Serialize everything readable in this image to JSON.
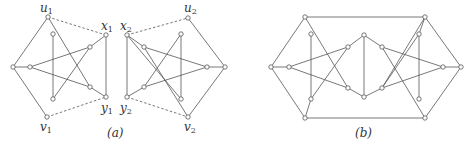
{
  "figure": {
    "panels": [
      {
        "id": "a",
        "caption": "(a)",
        "caption_pos": [
          117,
          137
        ],
        "labels": [
          {
            "base": "u",
            "sub": "1",
            "x": 40,
            "y": 12
          },
          {
            "base": "x",
            "sub": "1",
            "x": 101,
            "y": 30
          },
          {
            "base": "y",
            "sub": "1",
            "x": 101,
            "y": 112
          },
          {
            "base": "v",
            "sub": "1",
            "x": 40,
            "y": 131
          },
          {
            "base": "x",
            "sub": "2",
            "x": 120,
            "y": 30
          },
          {
            "base": "u",
            "sub": "2",
            "x": 184,
            "y": 12
          },
          {
            "base": "y",
            "sub": "2",
            "x": 120,
            "y": 112
          },
          {
            "base": "v",
            "sub": "2",
            "x": 184,
            "y": 131
          }
        ],
        "nodes": [
          [
            48,
            17
          ],
          [
            53,
            34
          ],
          [
            13,
            67
          ],
          [
            30,
            67
          ],
          [
            53,
            99
          ],
          [
            47,
            117
          ],
          [
            90,
            47
          ],
          [
            90,
            87
          ],
          [
            106,
            35
          ],
          [
            106,
            97
          ],
          [
            127,
            35
          ],
          [
            144,
            47
          ],
          [
            188,
            18
          ],
          [
            181,
            34
          ],
          [
            225,
            67
          ],
          [
            207,
            67
          ],
          [
            144,
            87
          ],
          [
            127,
            97
          ],
          [
            181,
            99
          ],
          [
            188,
            117
          ]
        ],
        "edges": [
          [
            [
              48,
              17
            ],
            [
              13,
              67
            ]
          ],
          [
            [
              13,
              67
            ],
            [
              47,
              117
            ]
          ],
          [
            [
              13,
              67
            ],
            [
              30,
              67
            ]
          ],
          [
            [
              48,
              17
            ],
            [
              90,
              87
            ]
          ],
          [
            [
              53,
              34
            ],
            [
              53,
              99
            ]
          ],
          [
            [
              30,
              67
            ],
            [
              90,
              47
            ]
          ],
          [
            [
              30,
              67
            ],
            [
              90,
              87
            ]
          ],
          [
            [
              53,
              99
            ],
            [
              90,
              47
            ]
          ],
          [
            [
              90,
              47
            ],
            [
              106,
              35
            ]
          ],
          [
            [
              90,
              87
            ],
            [
              106,
              97
            ]
          ],
          [
            [
              106,
              35
            ],
            [
              106,
              97
            ]
          ],
          [
            [
              127,
              35
            ],
            [
              144,
              47
            ]
          ],
          [
            [
              144,
              47
            ],
            [
              188,
              117
            ]
          ],
          [
            [
              188,
              18
            ],
            [
              225,
              67
            ]
          ],
          [
            [
              225,
              67
            ],
            [
              188,
              117
            ]
          ],
          [
            [
              225,
              67
            ],
            [
              207,
              67
            ]
          ],
          [
            [
              181,
              34
            ],
            [
              181,
              99
            ]
          ],
          [
            [
              181,
              34
            ],
            [
              144,
              87
            ]
          ],
          [
            [
              207,
              67
            ],
            [
              144,
              47
            ]
          ],
          [
            [
              207,
              67
            ],
            [
              144,
              87
            ]
          ],
          [
            [
              144,
              87
            ],
            [
              127,
              97
            ]
          ],
          [
            [
              127,
              35
            ],
            [
              127,
              97
            ]
          ],
          [
            [
              127,
              35
            ],
            [
              181,
              99
            ]
          ]
        ],
        "dashed_edges": [
          [
            [
              48,
              17
            ],
            [
              106,
              35
            ]
          ],
          [
            [
              47,
              117
            ],
            [
              106,
              97
            ]
          ],
          [
            [
              127,
              35
            ],
            [
              188,
              18
            ]
          ],
          [
            [
              127,
              97
            ],
            [
              188,
              117
            ]
          ]
        ]
      },
      {
        "id": "b",
        "caption": "(b)",
        "caption_pos": [
          365,
          137
        ],
        "nodes": [
          [
            305,
            17
          ],
          [
            425,
            17
          ],
          [
            271,
            67
          ],
          [
            461,
            67
          ],
          [
            305,
            118
          ],
          [
            425,
            118
          ],
          [
            311,
            34
          ],
          [
            289,
            67
          ],
          [
            311,
            99
          ],
          [
            348,
            47
          ],
          [
            348,
            88
          ],
          [
            364,
            35
          ],
          [
            364,
            97
          ],
          [
            382,
            47
          ],
          [
            382,
            88
          ],
          [
            419,
            34
          ],
          [
            443,
            67
          ],
          [
            419,
            99
          ]
        ],
        "edges": [
          [
            [
              305,
              17
            ],
            [
              425,
              17
            ]
          ],
          [
            [
              305,
              118
            ],
            [
              425,
              118
            ]
          ],
          [
            [
              305,
              17
            ],
            [
              271,
              67
            ]
          ],
          [
            [
              271,
              67
            ],
            [
              305,
              118
            ]
          ],
          [
            [
              425,
              17
            ],
            [
              461,
              67
            ]
          ],
          [
            [
              461,
              67
            ],
            [
              425,
              118
            ]
          ],
          [
            [
              271,
              67
            ],
            [
              289,
              67
            ]
          ],
          [
            [
              461,
              67
            ],
            [
              443,
              67
            ]
          ],
          [
            [
              305,
              17
            ],
            [
              348,
              88
            ]
          ],
          [
            [
              311,
              34
            ],
            [
              311,
              99
            ]
          ],
          [
            [
              289,
              67
            ],
            [
              348,
              47
            ]
          ],
          [
            [
              289,
              67
            ],
            [
              348,
              88
            ]
          ],
          [
            [
              311,
              99
            ],
            [
              348,
              47
            ]
          ],
          [
            [
              348,
              47
            ],
            [
              364,
              35
            ]
          ],
          [
            [
              348,
              88
            ],
            [
              364,
              97
            ]
          ],
          [
            [
              364,
              35
            ],
            [
              364,
              97
            ]
          ],
          [
            [
              364,
              35
            ],
            [
              382,
              47
            ]
          ],
          [
            [
              364,
              97
            ],
            [
              382,
              88
            ]
          ],
          [
            [
              425,
              17
            ],
            [
              382,
              88
            ]
          ],
          [
            [
              419,
              34
            ],
            [
              419,
              99
            ]
          ],
          [
            [
              443,
              67
            ],
            [
              382,
              47
            ]
          ],
          [
            [
              443,
              67
            ],
            [
              382,
              88
            ]
          ],
          [
            [
              419,
              34
            ],
            [
              382,
              88
            ]
          ],
          [
            [
              382,
              47
            ],
            [
              425,
              118
            ]
          ],
          [
            [
              305,
              118
            ],
            [
              311,
              99
            ]
          ],
          [
            [
              425,
              17
            ],
            [
              419,
              34
            ]
          ]
        ]
      }
    ]
  },
  "captions": {
    "a": "(a)",
    "b": "(b)"
  },
  "colors": {
    "stroke": "#555555",
    "background": "#ffffff",
    "text": "#333333"
  }
}
